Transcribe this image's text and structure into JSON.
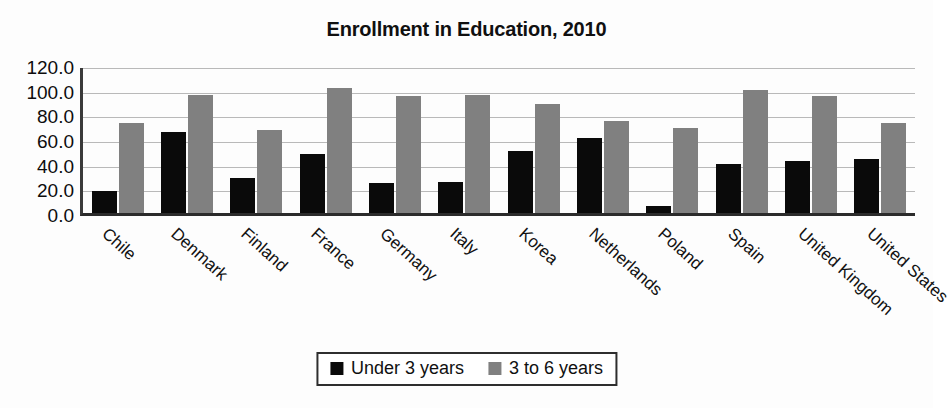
{
  "chart_data": {
    "type": "bar",
    "title": "Enrollment in Education, 2010",
    "xlabel": "",
    "ylabel": "",
    "ylim": [
      0,
      120
    ],
    "ytick_step": 20,
    "yticks": [
      "120.0",
      "100.0",
      "80.0",
      "60.0",
      "40.0",
      "20.0",
      "0.0"
    ],
    "grid": true,
    "legend_position": "bottom-center",
    "categories": [
      "Chile",
      "Denmark",
      "Finland",
      "France",
      "Germany",
      "Italy",
      "Korea",
      "Netherlands",
      "Poland",
      "Spain",
      "United Kingdom",
      "United States"
    ],
    "series": [
      {
        "name": "Under 3 years",
        "color": "#0a0a0a",
        "values": [
          18.0,
          65.5,
          28.0,
          48.0,
          24.0,
          25.0,
          50.5,
          61.0,
          6.0,
          39.5,
          42.5,
          43.5
        ]
      },
      {
        "name": "3 to 6 years",
        "color": "#808080",
        "values": [
          73.0,
          95.5,
          67.0,
          101.5,
          95.0,
          96.0,
          88.5,
          75.0,
          69.0,
          99.5,
          94.5,
          73.0
        ]
      }
    ]
  },
  "legend": {
    "entries": [
      {
        "label": "Under 3 years"
      },
      {
        "label": "3 to 6 years"
      }
    ]
  }
}
